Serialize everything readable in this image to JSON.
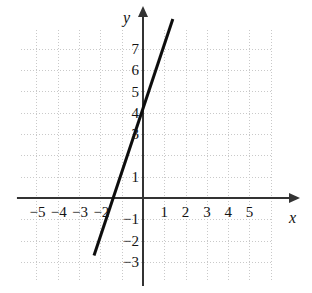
{
  "chart_data": {
    "type": "line",
    "title": "",
    "xlabel": "x",
    "ylabel": "y",
    "xlim": [
      -6.7,
      6.0
    ],
    "ylim": [
      -4.3,
      8.6
    ],
    "grid": true,
    "grid_style": "dotted",
    "legend": "none",
    "series": [
      {
        "name": "line",
        "equation": "y = 3x + 4.2",
        "slope": 3,
        "intercept": 4.2,
        "x": [
          -2.3,
          1.4
        ],
        "y": [
          -2.7,
          8.4
        ],
        "color": "#0d0d0d",
        "width": 3
      }
    ],
    "x_ticks": [
      {
        "value": -5,
        "label": "−5"
      },
      {
        "value": -4,
        "label": "−4"
      },
      {
        "value": -3,
        "label": "−3"
      },
      {
        "value": -2,
        "label": "−2"
      },
      {
        "value": 1,
        "label": "1"
      },
      {
        "value": 2,
        "label": "2"
      },
      {
        "value": 3,
        "label": "3"
      },
      {
        "value": 4,
        "label": "4"
      },
      {
        "value": 5,
        "label": "5"
      }
    ],
    "y_ticks": [
      {
        "value": 7,
        "label": "7"
      },
      {
        "value": 6,
        "label": "6"
      },
      {
        "value": 5,
        "label": "5"
      },
      {
        "value": 4,
        "label": "4"
      },
      {
        "value": 3,
        "label": "3"
      },
      {
        "value": 1,
        "label": "1"
      },
      {
        "value": -1,
        "label": "−1"
      },
      {
        "value": -2,
        "label": "−2"
      },
      {
        "value": -3,
        "label": "−3"
      }
    ],
    "hidden_tick_labels": {
      "x": [
        -1,
        0
      ],
      "y": [
        2,
        0
      ]
    },
    "axis_color": "#333333",
    "grid_color": "#b9b9b9",
    "background": "#ffffff"
  },
  "axes": {
    "x_label": "x",
    "y_label": "y"
  }
}
